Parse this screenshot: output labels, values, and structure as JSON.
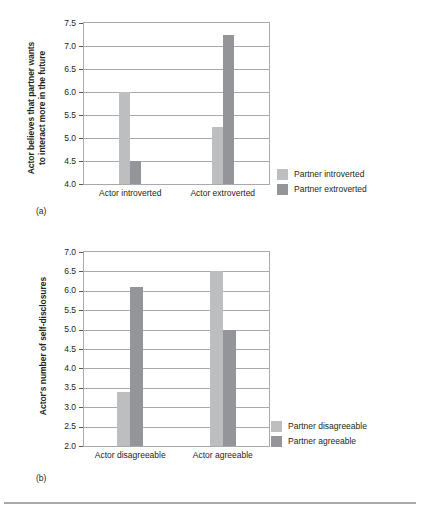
{
  "figure": {
    "background_color": "#ffffff",
    "bar_light_color": "#bcbec0",
    "bar_dark_color": "#939598",
    "axis_color": "#a7a9ac",
    "text_color": "#231f20"
  },
  "panels": [
    {
      "letter": "(a)",
      "ylabel": "Actor believes that partner wants\nto interact more in the future"
    },
    {
      "letter": "(b)",
      "ylabel": "Actor's number of self-disclosures"
    }
  ],
  "chart_data": [
    {
      "type": "bar",
      "title": "",
      "panel": "(a)",
      "xlabel": "",
      "ylabel": "Actor believes that partner wants to interact more in the future",
      "categories": [
        "Actor introverted",
        "Actor extroverted"
      ],
      "series": [
        {
          "name": "Partner introverted",
          "color": "#bcbec0",
          "values": [
            6.0,
            5.25
          ]
        },
        {
          "name": "Partner extroverted",
          "color": "#939598",
          "values": [
            4.5,
            7.25
          ]
        }
      ],
      "ylim": [
        4.0,
        7.5
      ],
      "ytick_step": 0.5,
      "yticks": [
        "7.5",
        "7.0",
        "6.5",
        "6.0",
        "5.5",
        "5.0",
        "4.5",
        "4.0"
      ],
      "grid": true,
      "legend_position": "right"
    },
    {
      "type": "bar",
      "title": "",
      "panel": "(b)",
      "xlabel": "",
      "ylabel": "Actor's number of self-disclosures",
      "categories": [
        "Actor disagreeable",
        "Actor agreeable"
      ],
      "series": [
        {
          "name": "Partner disagreeable",
          "color": "#bcbec0",
          "values": [
            3.4,
            6.5
          ]
        },
        {
          "name": "Partner agreeable",
          "color": "#939598",
          "values": [
            6.1,
            5.0
          ]
        }
      ],
      "ylim": [
        2.0,
        7.0
      ],
      "ytick_step": 0.5,
      "yticks": [
        "7.0",
        "6.5",
        "6.0",
        "5.5",
        "5.0",
        "4.5",
        "4.0",
        "3.5",
        "3.0",
        "2.5",
        "2.0"
      ],
      "grid": true,
      "legend_position": "right"
    }
  ]
}
